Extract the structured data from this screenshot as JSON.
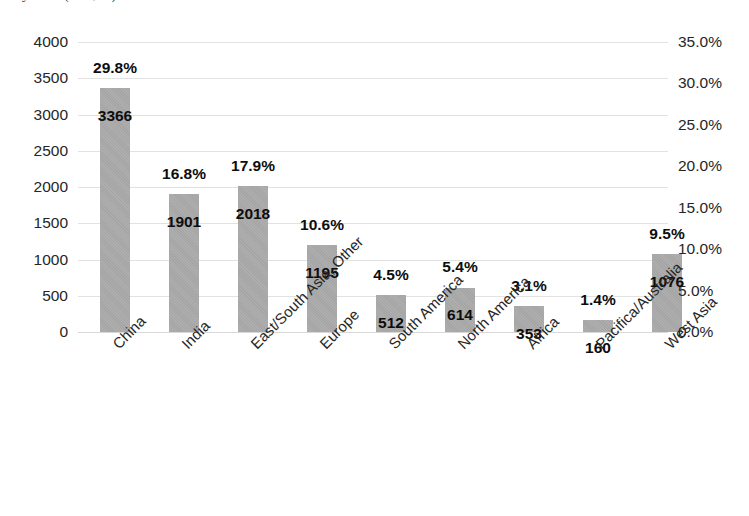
{
  "title_remnant": "y 2014 (MW, %)",
  "chart_data": {
    "type": "bar",
    "title": "",
    "subtitle": "",
    "xlabel": "",
    "ylabel": "",
    "y2label": "",
    "grid": true,
    "legend": "none",
    "categories": [
      "China",
      "India",
      "East/South Asia, Other",
      "Europe",
      "South America",
      "North America",
      "Africa",
      "Pacifica/Australia",
      "West Asia"
    ],
    "values": [
      3366,
      1901,
      2018,
      1195,
      512,
      614,
      353,
      160,
      1076
    ],
    "value_labels": [
      "3366",
      "1901",
      "2018",
      "1195",
      "512",
      "614",
      "353",
      "160",
      "1076"
    ],
    "percent_values": [
      29.8,
      16.8,
      17.9,
      10.6,
      4.5,
      5.4,
      3.1,
      1.4,
      9.5
    ],
    "percent_labels": [
      "29.8%",
      "16.8%",
      "17.9%",
      "10.6%",
      "4.5%",
      "5.4%",
      "3.1%",
      "1.4%",
      "9.5%"
    ],
    "ylim": [
      0,
      4000
    ],
    "yticks": [
      0,
      500,
      1000,
      1500,
      2000,
      2500,
      3000,
      3500,
      4000
    ],
    "ytick_labels": [
      "0",
      "500",
      "1000",
      "1500",
      "2000",
      "2500",
      "3000",
      "3500",
      "4000"
    ],
    "y2lim": [
      0,
      35
    ],
    "y2ticks": [
      0,
      5,
      10,
      15,
      20,
      25,
      30,
      35
    ],
    "y2tick_labels": [
      "0.0%",
      "5.0%",
      "10.0%",
      "15.0%",
      "20.0%",
      "25.0%",
      "30.0%",
      "35.0%"
    ],
    "series": [
      {
        "name": "Capacity (MW)",
        "axis": "left",
        "values": [
          3366,
          1901,
          2018,
          1195,
          512,
          614,
          353,
          160,
          1076
        ]
      },
      {
        "name": "Share (%)",
        "axis": "right",
        "values": [
          29.8,
          16.8,
          17.9,
          10.6,
          4.5,
          5.4,
          3.1,
          1.4,
          9.5
        ]
      }
    ],
    "colors": {
      "bar": "#a5a5a5",
      "grid": "#e2e2e2",
      "text": "#262626"
    }
  }
}
